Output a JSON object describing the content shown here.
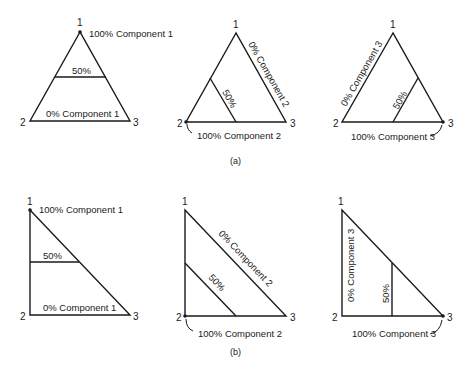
{
  "figure": {
    "captions": {
      "a": "(a)",
      "b": "(b)"
    },
    "vertices": {
      "v1": "1",
      "v2": "2",
      "v3": "3"
    },
    "panels": {
      "a1": {
        "top_label": "100% Component 1",
        "mid_label": "50%",
        "base_label": "0% Component 1"
      },
      "a2": {
        "side_label": "0% Component 2",
        "mid_label": "50%",
        "corner_label": "100% Component 2"
      },
      "a3": {
        "side_label": "0% Component 3",
        "mid_label": "50%",
        "corner_label": "100% Component 3"
      },
      "b1": {
        "top_label": "100% Component 1",
        "mid_label": "50%",
        "base_label": "0% Component 1"
      },
      "b2": {
        "side_label": "0% Component 2",
        "mid_label": "50%",
        "corner_label": "100% Component 2"
      },
      "b3": {
        "side_label": "0% Component 3",
        "mid_label": "50%",
        "corner_label": "100% Component 3"
      }
    },
    "colors": {
      "ink": "#1a1a1a",
      "background": "#ffffff"
    }
  }
}
